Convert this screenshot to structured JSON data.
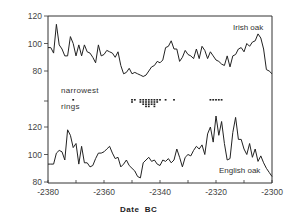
{
  "chart_data": {
    "type": "line",
    "title": "",
    "xlabel": "Date  BC",
    "ylabel": "",
    "xlim": [
      -2380,
      -2300
    ],
    "x_ticks": [
      -2380,
      -2360,
      -2340,
      -2320,
      -2300
    ],
    "x_tick_labels": [
      "-2380",
      "-2360",
      "-2340",
      "-2320",
      "-2300"
    ],
    "grid": false,
    "panels": [
      {
        "name": "Irish oak",
        "ylim": [
          75,
          120
        ],
        "y_ticks": [
          80,
          100,
          120
        ],
        "y_tick_labels": [
          "80",
          "100",
          "120"
        ],
        "x": [
          -2380,
          -2379,
          -2378,
          -2377,
          -2376,
          -2375,
          -2374,
          -2373,
          -2372,
          -2371,
          -2370,
          -2369,
          -2368,
          -2367,
          -2366,
          -2365,
          -2364,
          -2363,
          -2362,
          -2361,
          -2360,
          -2359,
          -2358,
          -2357,
          -2356,
          -2355,
          -2354,
          -2353,
          -2352,
          -2351,
          -2350,
          -2349,
          -2348,
          -2347,
          -2346,
          -2345,
          -2344,
          -2343,
          -2342,
          -2341,
          -2340,
          -2339,
          -2338,
          -2337,
          -2336,
          -2335,
          -2334,
          -2333,
          -2332,
          -2331,
          -2330,
          -2329,
          -2328,
          -2327,
          -2326,
          -2325,
          -2324,
          -2323,
          -2322,
          -2321,
          -2320,
          -2319,
          -2318,
          -2317,
          -2316,
          -2315,
          -2314,
          -2313,
          -2312,
          -2311,
          -2310,
          -2309,
          -2308,
          -2307,
          -2306,
          -2305,
          -2304,
          -2303,
          -2302,
          -2301,
          -2300
        ],
        "values": [
          97,
          97,
          93,
          114,
          99,
          96,
          91,
          91,
          105,
          100,
          91,
          99,
          91,
          99,
          94,
          93,
          90,
          86,
          99,
          91,
          92,
          95,
          94,
          93,
          90,
          94,
          84,
          78,
          79,
          82,
          78,
          79,
          78,
          77,
          76,
          77,
          80,
          83,
          84,
          87,
          86,
          88,
          97,
          98,
          102,
          96,
          96,
          87,
          90,
          95,
          92,
          91,
          89,
          96,
          89,
          98,
          95,
          89,
          94,
          91,
          88,
          87,
          85,
          84,
          91,
          83,
          91,
          92,
          96,
          97,
          94,
          100,
          98,
          101,
          102,
          107,
          104,
          96,
          81,
          80,
          78
        ],
        "label_position": "top-right"
      },
      {
        "name": "English oak",
        "ylim": [
          80,
          130
        ],
        "y_ticks": [
          80,
          100,
          120
        ],
        "y_tick_labels": [
          "80",
          "100",
          "120"
        ],
        "x": [
          -2380,
          -2379,
          -2378,
          -2377,
          -2376,
          -2375,
          -2374,
          -2373,
          -2372,
          -2371,
          -2370,
          -2369,
          -2368,
          -2367,
          -2366,
          -2365,
          -2364,
          -2363,
          -2362,
          -2361,
          -2360,
          -2359,
          -2358,
          -2357,
          -2356,
          -2355,
          -2354,
          -2353,
          -2352,
          -2351,
          -2350,
          -2349,
          -2348,
          -2347,
          -2346,
          -2345,
          -2344,
          -2343,
          -2342,
          -2341,
          -2340,
          -2339,
          -2338,
          -2337,
          -2336,
          -2335,
          -2334,
          -2333,
          -2332,
          -2331,
          -2330,
          -2329,
          -2328,
          -2327,
          -2326,
          -2325,
          -2324,
          -2323,
          -2322,
          -2321,
          -2320,
          -2319,
          -2318,
          -2317,
          -2316,
          -2315,
          -2314,
          -2313,
          -2312,
          -2311,
          -2310,
          -2309,
          -2308,
          -2307,
          -2306,
          -2305,
          -2304,
          -2303,
          -2302,
          -2301,
          -2300
        ],
        "values": [
          93,
          93,
          93,
          101,
          103,
          102,
          96,
          118,
          114,
          105,
          108,
          93,
          106,
          94,
          94,
          91,
          92,
          97,
          101,
          101,
          102,
          104,
          106,
          101,
          97,
          98,
          91,
          93,
          96,
          92,
          90,
          88,
          84,
          83,
          94,
          96,
          98,
          95,
          96,
          93,
          92,
          96,
          95,
          97,
          94,
          96,
          104,
          98,
          91,
          98,
          100,
          99,
          103,
          106,
          104,
          107,
          100,
          115,
          120,
          109,
          128,
          114,
          124,
          108,
          96,
          97,
          116,
          127,
          111,
          111,
          104,
          100,
          108,
          98,
          104,
          95,
          99,
          94,
          90,
          87,
          84
        ],
        "label_position": "bottom-right"
      }
    ],
    "narrowest_rings": {
      "label": [
        "narrowest",
        "rings"
      ],
      "years": [
        -2371,
        -2350,
        -2349,
        -2347,
        -2346,
        -2345,
        -2344,
        -2343,
        -2342,
        -2341,
        -2340,
        -2338,
        -2335,
        -2322,
        -2321,
        -2320,
        -2319,
        -2318
      ],
      "counts": [
        1,
        2,
        1,
        2,
        3,
        4,
        4,
        3,
        4,
        2,
        1,
        1,
        1,
        1,
        1,
        1,
        1,
        1
      ]
    },
    "legend_position": "inline-labels"
  },
  "labels": {
    "irish": "Irish oak",
    "english": "English oak",
    "narrowest_1": "narrowest",
    "narrowest_2": "rings",
    "xlabel": "Date  BC"
  }
}
